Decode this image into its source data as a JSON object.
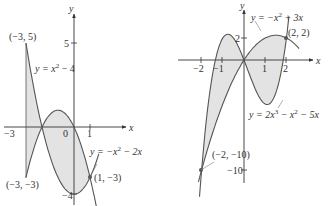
{
  "chart_data": [
    {
      "type": "area",
      "title": "",
      "xlabel": "x",
      "ylabel": "y",
      "curves": [
        {
          "name": "y = x^2 - 4",
          "label_parts": [
            "y = x",
            "2",
            " − 4"
          ]
        },
        {
          "name": "y = -x^2 - 2x",
          "label_parts": [
            "y = −x",
            "2",
            " − 2x"
          ]
        }
      ],
      "x_ticks": [
        "−3",
        "0",
        "1"
      ],
      "y_ticks": [
        "5",
        "−4"
      ],
      "points": [
        {
          "label": "(−3, 5)",
          "x": -3,
          "y": 5
        },
        {
          "label": "(−3, −3)",
          "x": -3,
          "y": -3
        },
        {
          "label": "(1, −3)",
          "x": 1,
          "y": -3
        }
      ],
      "shaded_region": {
        "x_from": -3,
        "x_to": 1
      }
    },
    {
      "type": "area",
      "title": "",
      "xlabel": "x",
      "ylabel": "y",
      "curves": [
        {
          "name": "y = -x^2 + 3x",
          "label_parts": [
            "y = −x",
            "2",
            " + 3x"
          ]
        },
        {
          "name": "y = 2x^3 - x^2 - 5x",
          "label_parts": [
            "y = 2x",
            "3",
            " − x",
            "2",
            " − 5x"
          ]
        }
      ],
      "x_ticks": [
        "−2",
        "−1",
        "1",
        "2"
      ],
      "y_ticks": [
        "2",
        "−10"
      ],
      "points": [
        {
          "label": "(2, 2)",
          "x": 2,
          "y": 2
        },
        {
          "label": "(−2, −10)",
          "x": -2,
          "y": -10
        }
      ],
      "shaded_region": {
        "x_from": -2,
        "x_to": 2
      }
    }
  ]
}
